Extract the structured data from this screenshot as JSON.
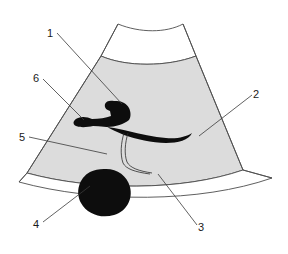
{
  "figure": {
    "kind": "ultrasound-sector-scan-diagram",
    "background_color": "#ffffff",
    "sector": {
      "tissue_fill_color": "#dcdcdc",
      "outline_color": "#4d4d4d",
      "near_field_band_color": "#ffffff",
      "far_field_band_color": "#ffffff"
    },
    "structures": {
      "vessel_color": "#0d0d0d",
      "lesion_color": "#0d0d0d",
      "duct_color": "#1a1a1a"
    }
  },
  "labels": [
    {
      "id": "1",
      "text": "1",
      "x": 50,
      "y": 37,
      "leader_to_x": 122,
      "leader_to_y": 104
    },
    {
      "id": "2",
      "text": "2",
      "x": 256,
      "y": 98,
      "leader_to_x": 199,
      "leader_to_y": 136
    },
    {
      "id": "3",
      "text": "3",
      "x": 201,
      "y": 231,
      "leader_to_x": 158,
      "leader_to_y": 174
    },
    {
      "id": "4",
      "text": "4",
      "x": 36,
      "y": 228,
      "leader_to_x": 90,
      "leader_to_y": 186
    },
    {
      "id": "5",
      "text": "5",
      "x": 22,
      "y": 141,
      "leader_to_x": 107,
      "leader_to_y": 154
    },
    {
      "id": "6",
      "text": "6",
      "x": 36,
      "y": 82,
      "leader_to_x": 84,
      "leader_to_y": 120
    }
  ]
}
